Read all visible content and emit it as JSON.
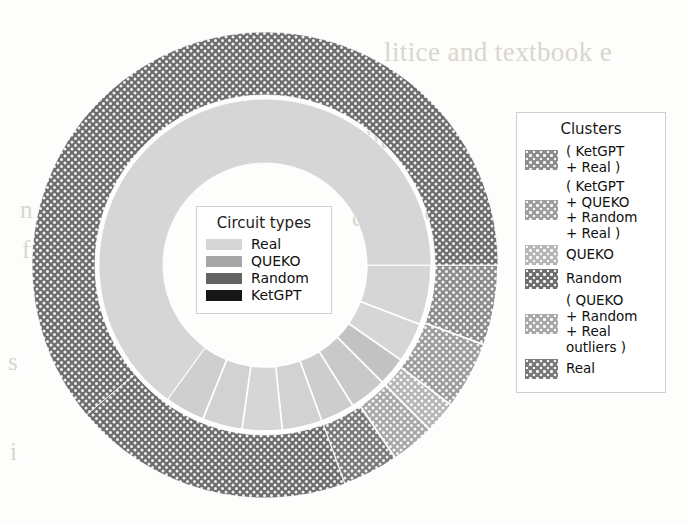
{
  "figure": {
    "kind": "nested-donut-sunburst",
    "background_text": [
      "litice and textbook e",
      "ilit",
      "po",
      "de",
      "and ev",
      "of th",
      "to t"
    ]
  },
  "circuit_legend": {
    "title": "Circuit types",
    "items": [
      {
        "label": "Real",
        "color": "#d6d6d6",
        "pattern": "flat"
      },
      {
        "label": "QUEKO",
        "color": "#a6a6a6",
        "pattern": "flat"
      },
      {
        "label": "Random",
        "color": "#636363",
        "pattern": "flat"
      },
      {
        "label": "KetGPT",
        "color": "#161616",
        "pattern": "flat"
      }
    ]
  },
  "clusters_legend": {
    "title": "Clusters",
    "items": [
      {
        "label": "( KetGPT\n+ Real )",
        "color": "#8c8c8c",
        "pattern": "dots"
      },
      {
        "label": "( KetGPT\n+ QUEKO\n+ Random\n+ Real )",
        "color": "#9e9e9e",
        "pattern": "dots"
      },
      {
        "label": "QUEKO",
        "color": "#b5b5b5",
        "pattern": "dots"
      },
      {
        "label": "Random",
        "color": "#6e6e6e",
        "pattern": "dots"
      },
      {
        "label": "( QUEKO\n+ Random\n+ Real\noutliers )",
        "color": "#a8a8a8",
        "pattern": "dots"
      },
      {
        "label": "Real",
        "color": "#7a7a7a",
        "pattern": "dots"
      }
    ]
  },
  "chart_data": {
    "type": "pie",
    "title": "",
    "subtype": "nested donut (sunburst), 2 rings, grayscale hatched",
    "geometry": {
      "center_x": 265,
      "center_y": 265,
      "inner_hole_radius": 102,
      "inner_ring_outer_radius": 166,
      "outer_ring_inner_radius": 170,
      "outer_ring_outer_radius": 233,
      "start_angle_deg": 0,
      "direction": "clockwise",
      "angle_zero_at": "3 o'clock"
    },
    "rings": [
      {
        "name": "inner",
        "legend": "Circuit types",
        "slices": [
          {
            "label": "Real",
            "start_deg": 0.0,
            "end_deg": 21.0,
            "color": "#d6d6d6",
            "pattern": "flat"
          },
          {
            "label": "Real",
            "start_deg": 21.0,
            "end_deg": 35.0,
            "color": "#d6d6d6",
            "pattern": "flat"
          },
          {
            "label": "QUEKO",
            "start_deg": 35.0,
            "end_deg": 45.0,
            "color": "#c2c2c2",
            "pattern": "flat"
          },
          {
            "label": "Random",
            "start_deg": 45.0,
            "end_deg": 58.0,
            "color": "#c9c9c9",
            "pattern": "flat"
          },
          {
            "label": "KetGPT",
            "start_deg": 58.0,
            "end_deg": 70.0,
            "color": "#cdcdcd",
            "pattern": "flat"
          },
          {
            "label": "Real",
            "start_deg": 70.0,
            "end_deg": 84.0,
            "color": "#d2d2d2",
            "pattern": "flat"
          },
          {
            "label": "Real",
            "start_deg": 84.0,
            "end_deg": 98.0,
            "color": "#d6d6d6",
            "pattern": "flat"
          },
          {
            "label": "Real",
            "start_deg": 98.0,
            "end_deg": 112.0,
            "color": "#d2d2d2",
            "pattern": "flat"
          },
          {
            "label": "Real",
            "start_deg": 112.0,
            "end_deg": 126.0,
            "color": "#cfcfcf",
            "pattern": "flat"
          },
          {
            "label": "Real",
            "start_deg": 126.0,
            "end_deg": 360.0,
            "color": "#d6d6d6",
            "pattern": "flat"
          }
        ]
      },
      {
        "name": "outer",
        "legend": "Clusters",
        "slices": [
          {
            "label": "( KetGPT + Real )",
            "start_deg": 0.0,
            "end_deg": 20.0,
            "color": "#8c8c8c",
            "pattern": "dots"
          },
          {
            "label": "( KetGPT + QUEKO + Random + Real )",
            "start_deg": 20.0,
            "end_deg": 37.0,
            "color": "#9c9c9c",
            "pattern": "dots"
          },
          {
            "label": "QUEKO",
            "start_deg": 37.0,
            "end_deg": 45.0,
            "color": "#b5b5b5",
            "pattern": "dots"
          },
          {
            "label": "( QUEKO + Random + Real outliers )",
            "start_deg": 45.0,
            "end_deg": 56.0,
            "color": "#a8a8a8",
            "pattern": "dots"
          },
          {
            "label": "Real",
            "start_deg": 56.0,
            "end_deg": 70.0,
            "color": "#7a7a7a",
            "pattern": "dots"
          },
          {
            "label": "Random",
            "start_deg": 70.0,
            "end_deg": 140.0,
            "color": "#6e6e6e",
            "pattern": "dots"
          },
          {
            "label": "Random",
            "start_deg": 140.0,
            "end_deg": 360.0,
            "color": "#6e6e6e",
            "pattern": "dots"
          }
        ]
      }
    ]
  }
}
